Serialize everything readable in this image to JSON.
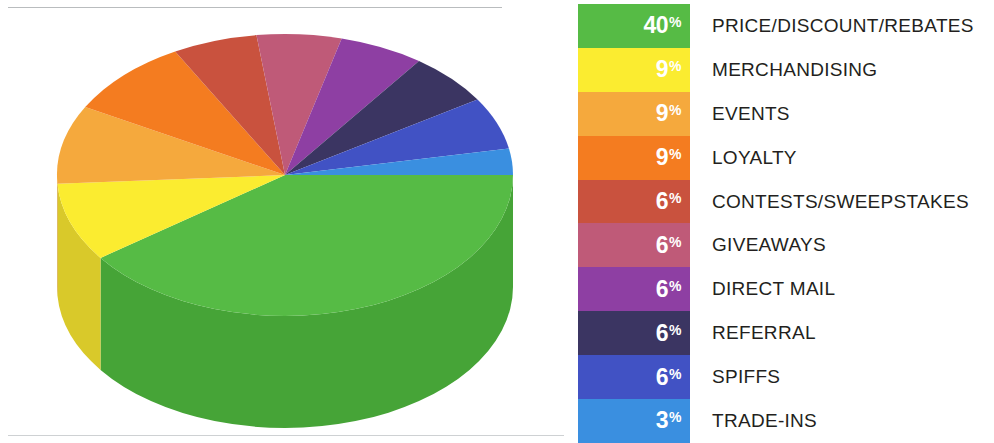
{
  "chart_data": {
    "type": "pie",
    "title": "",
    "subtitle": "",
    "xlabel": "",
    "ylabel": "",
    "legend_position": "right",
    "grid": false,
    "units": "percent",
    "total": 100,
    "categories": [
      "PRICE/DISCOUNT/REBATES",
      "MERCHANDISING",
      "EVENTS",
      "LOYALTY",
      "CONTESTS/SWEEPSTAKES",
      "GIVEAWAYS",
      "DIRECT MAIL",
      "REFERRAL",
      "SPIFFS",
      "TRADE-INS"
    ],
    "values": [
      40,
      9,
      9,
      9,
      6,
      6,
      6,
      6,
      6,
      3
    ],
    "value_labels": [
      "40%",
      "9%",
      "9%",
      "9%",
      "6%",
      "6%",
      "6%",
      "6%",
      "6%",
      "3%"
    ],
    "colors": [
      "#56bb45",
      "#fbec30",
      "#f5a93d",
      "#f47c20",
      "#c9523e",
      "#bf5a78",
      "#8e3fa3",
      "#3b3562",
      "#4152c4",
      "#3a8fe0"
    ],
    "series": [
      {
        "name": "Share of promotions",
        "values": [
          40,
          9,
          9,
          9,
          6,
          6,
          6,
          6,
          6,
          3
        ]
      }
    ]
  },
  "pie": {
    "name": "promotions-share-pie-chart",
    "style": "3d-extruded",
    "slices": [
      {
        "label": "PRICE/DISCOUNT/REBATES",
        "value": 40,
        "value_label": "40%",
        "color": "#56bb45",
        "side_color": "#46a437"
      },
      {
        "label": "MERCHANDISING",
        "value": 9,
        "value_label": "9%",
        "color": "#fbec30",
        "side_color": "#d9c92a"
      },
      {
        "label": "EVENTS",
        "value": 9,
        "value_label": "9%",
        "color": "#f5a93d",
        "side_color": "#d18f33"
      },
      {
        "label": "LOYALTY",
        "value": 9,
        "value_label": "9%",
        "color": "#f47c20",
        "side_color": "#cf671b"
      },
      {
        "label": "CONTESTS/SWEEPSTAKES",
        "value": 6,
        "value_label": "6%",
        "color": "#c9523e",
        "side_color": "#a94435"
      },
      {
        "label": "GIVEAWAYS",
        "value": 6,
        "value_label": "6%",
        "color": "#bf5a78",
        "side_color": "#a24c66"
      },
      {
        "label": "DIRECT MAIL",
        "value": 6,
        "value_label": "6%",
        "color": "#8e3fa3",
        "side_color": "#78358a"
      },
      {
        "label": "REFERRAL",
        "value": 6,
        "value_label": "6%",
        "color": "#3b3562",
        "side_color": "#312c53"
      },
      {
        "label": "SPIFFS",
        "value": 6,
        "value_label": "6%",
        "color": "#4152c4",
        "side_color": "#3745a5"
      },
      {
        "label": "TRADE-INS",
        "value": 3,
        "value_label": "3%",
        "color": "#3a8fe0",
        "side_color": "#3179bd"
      }
    ]
  },
  "legend": {
    "name": "chart-legend",
    "rows": [
      {
        "pct": "40",
        "sym": "%",
        "label": "PRICE/DISCOUNT/REBATES",
        "color": "#56bb45"
      },
      {
        "pct": "9",
        "sym": "%",
        "label": "MERCHANDISING",
        "color": "#fbec30"
      },
      {
        "pct": "9",
        "sym": "%",
        "label": "EVENTS",
        "color": "#f5a93d"
      },
      {
        "pct": "9",
        "sym": "%",
        "label": "LOYALTY",
        "color": "#f47c20"
      },
      {
        "pct": "6",
        "sym": "%",
        "label": "CONTESTS/SWEEPSTAKES",
        "color": "#c9523e"
      },
      {
        "pct": "6",
        "sym": "%",
        "label": "GIVEAWAYS",
        "color": "#bf5a78"
      },
      {
        "pct": "6",
        "sym": "%",
        "label": "DIRECT MAIL",
        "color": "#8e3fa3"
      },
      {
        "pct": "6",
        "sym": "%",
        "label": "REFERRAL",
        "color": "#3b3562"
      },
      {
        "pct": "6",
        "sym": "%",
        "label": "SPIFFS",
        "color": "#4152c4"
      },
      {
        "pct": "3",
        "sym": "%",
        "label": "TRADE-INS",
        "color": "#3a8fe0"
      }
    ]
  }
}
